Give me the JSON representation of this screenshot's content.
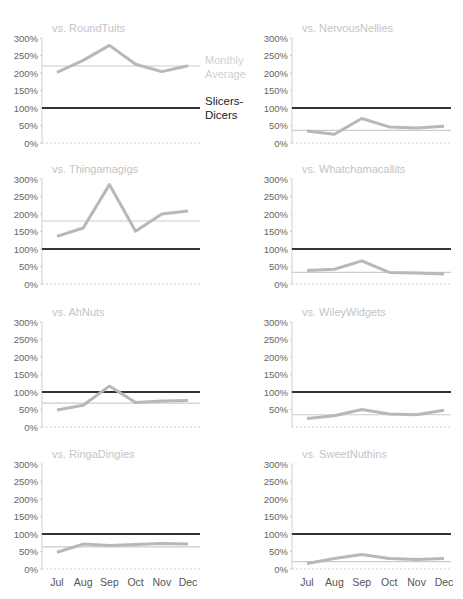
{
  "figure": {
    "legend": {
      "average_label_line1": "Monthly",
      "average_label_line2": "Average",
      "baseline_label_line1": "Slicers-",
      "baseline_label_line2": "Dicers"
    },
    "colors": {
      "series": "#b8b8b8",
      "average": "#cccccc",
      "baseline": "#333333",
      "axis": "#d0d0d0",
      "title": "#c4c4c4"
    }
  },
  "chart_data": [
    {
      "type": "line",
      "title": "vs. RoundTuits",
      "categories": [
        "Jul",
        "Aug",
        "Sep",
        "Oct",
        "Nov",
        "Dec"
      ],
      "values": [
        202,
        236,
        279,
        225,
        204,
        221
      ],
      "monthly_average": 220,
      "baseline": 100,
      "yticks": [
        "300%",
        "250%",
        "200%",
        "150%",
        "100%",
        "50%",
        "0%"
      ],
      "ylim": [
        0,
        300
      ],
      "show_xlabels": false
    },
    {
      "type": "line",
      "title": "vs. NervousNellies",
      "categories": [
        "Jul",
        "Aug",
        "Sep",
        "Oct",
        "Nov",
        "Dec"
      ],
      "values": [
        34,
        25,
        70,
        46,
        43,
        48
      ],
      "monthly_average": 36,
      "baseline": 100,
      "yticks": [
        "300%",
        "250%",
        "200%",
        "150%",
        "100%",
        "50%",
        "0%"
      ],
      "ylim": [
        0,
        300
      ],
      "show_xlabels": false
    },
    {
      "type": "line",
      "title": "vs. Thingamagigs",
      "categories": [
        "Jul",
        "Aug",
        "Sep",
        "Oct",
        "Nov",
        "Dec"
      ],
      "values": [
        136,
        160,
        284,
        151,
        200,
        209
      ],
      "monthly_average": 180,
      "baseline": 100,
      "yticks": [
        "300%",
        "250%",
        "200%",
        "150%",
        "100%",
        "50%",
        "0%"
      ],
      "ylim": [
        0,
        300
      ],
      "show_xlabels": false
    },
    {
      "type": "line",
      "title": "vs. Whatchamacallits",
      "categories": [
        "Jul",
        "Aug",
        "Sep",
        "Oct",
        "Nov",
        "Dec"
      ],
      "values": [
        39,
        42,
        66,
        33,
        31,
        29
      ],
      "monthly_average": 33,
      "baseline": 100,
      "yticks": [
        "300%",
        "250%",
        "200%",
        "150%",
        "100%",
        "50%",
        "0%"
      ],
      "ylim": [
        0,
        300
      ],
      "show_xlabels": false
    },
    {
      "type": "line",
      "title": "vs. AhNuts",
      "categories": [
        "Jul",
        "Aug",
        "Sep",
        "Oct",
        "Nov",
        "Dec"
      ],
      "values": [
        49,
        62,
        117,
        70,
        74,
        76
      ],
      "monthly_average": 68,
      "baseline": 100,
      "yticks": [
        "300%",
        "250%",
        "200%",
        "150%",
        "100%",
        "50%",
        "0%"
      ],
      "ylim": [
        0,
        300
      ],
      "show_xlabels": false
    },
    {
      "type": "line",
      "title": "vs. WileyWidgets",
      "categories": [
        "Jul",
        "Aug",
        "Sep",
        "Oct",
        "Nov",
        "Dec"
      ],
      "values": [
        24,
        32,
        50,
        37,
        35,
        48
      ],
      "monthly_average": 35,
      "baseline": 100,
      "yticks": [
        "300%",
        "250%",
        "200%",
        "150%",
        "100%",
        "50%"
      ],
      "ylim": [
        0,
        300
      ],
      "show_xlabels": false
    },
    {
      "type": "line",
      "title": "vs. RingaDingies",
      "categories": [
        "Jul",
        "Aug",
        "Sep",
        "Oct",
        "Nov",
        "Dec"
      ],
      "values": [
        48,
        71,
        67,
        70,
        73,
        71
      ],
      "monthly_average": 63,
      "baseline": 100,
      "yticks": [
        "300%",
        "250%",
        "200%",
        "150%",
        "100%",
        "50%",
        "0%"
      ],
      "ylim": [
        0,
        300
      ],
      "show_xlabels": true
    },
    {
      "type": "line",
      "title": "vs. SweetNuthins",
      "categories": [
        "Jul",
        "Aug",
        "Sep",
        "Oct",
        "Nov",
        "Dec"
      ],
      "values": [
        16,
        30,
        41,
        30,
        27,
        30
      ],
      "monthly_average": 21,
      "baseline": 100,
      "yticks": [
        "300%",
        "250%",
        "200%",
        "150%",
        "100%",
        "50%",
        "0%"
      ],
      "ylim": [
        0,
        300
      ],
      "show_xlabels": true
    }
  ]
}
